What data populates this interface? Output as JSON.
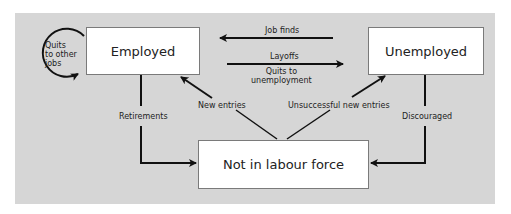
{
  "states": {
    "employed": "Employed",
    "unemployed": "Unemployed",
    "not_in_labour_force": "Not in labour force"
  },
  "flows": {
    "quits_to_other_jobs": "Quits to other jobs",
    "quits_line1": "Quits",
    "quits_line2": "to other",
    "quits_line3": "jobs",
    "job_finds": "Job finds",
    "layoffs": "Layoffs",
    "quits_to_unemployment_line1": "Quits to",
    "quits_to_unemployment_line2": "unemployment",
    "new_entries": "New entries",
    "unsuccessful_new_entries": "Unsuccessful new entries",
    "retirements": "Retirements",
    "discouraged": "Discouraged"
  },
  "colors": {
    "panel": "#d6d6d6",
    "box": "#ffffff",
    "arrow": "#111111"
  }
}
